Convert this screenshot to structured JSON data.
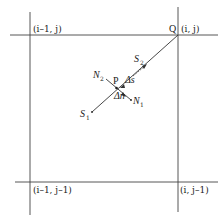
{
  "diagram": {
    "type": "grid-stencil",
    "nodes": {
      "top_left": "(i–1, j)",
      "top_right": "(i, j)",
      "bottom_left": "(i–1, j–1)",
      "bottom_right": "(i, j–1)"
    },
    "points": {
      "Q": "Q",
      "P": "P"
    },
    "streamline_labels": {
      "S1": "S",
      "S1_sub": "1",
      "S2": "S",
      "S2_sub": "2"
    },
    "normal_labels": {
      "N1": "N",
      "N1_sub": "1",
      "N2": "N",
      "N2_sub": "2"
    },
    "increments": {
      "delta_s": "Δs",
      "delta_n": "Δn"
    },
    "colors": {
      "line": "#333333",
      "background": "#ffffff"
    }
  }
}
